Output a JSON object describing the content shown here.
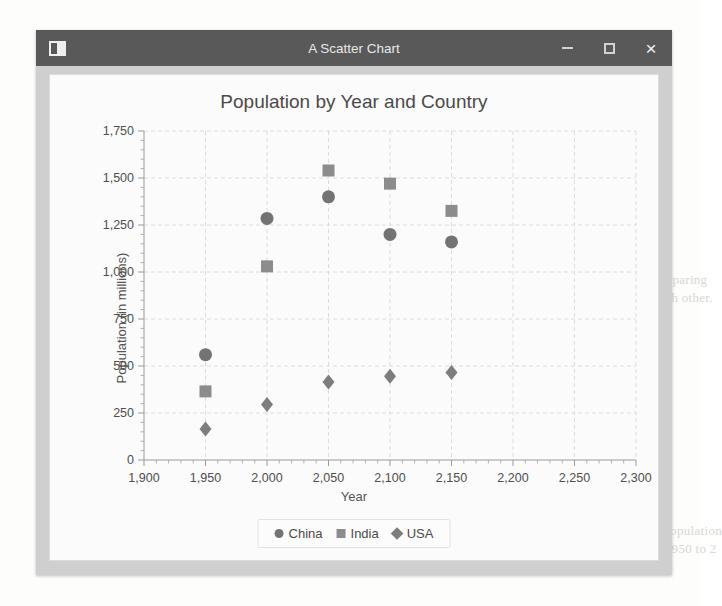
{
  "window": {
    "title": "A Scatter Chart",
    "app_icon": "window-app-icon",
    "controls": {
      "minimize": "–",
      "maximize": "□",
      "close": "×"
    }
  },
  "background_text": [
    "Chart",
    "Scatter plots are useful for comparing",
    "two numeric values against each other.",
    "this case, the example shows a population",
    "estimate for each country from 1950 to 2"
  ],
  "chart_data": {
    "type": "scatter",
    "title": "Population by Year and Country",
    "xlabel": "Year",
    "ylabel": "Population (in millions)",
    "xlim": [
      1900,
      2300
    ],
    "ylim": [
      0,
      1750
    ],
    "xticks": [
      1900,
      1950,
      2000,
      2050,
      2100,
      2150,
      2200,
      2250,
      2300
    ],
    "xticklabels": [
      "1,900",
      "1,950",
      "2,000",
      "2,050",
      "2,100",
      "2,150",
      "2,200",
      "2,250",
      "2,300"
    ],
    "yticks": [
      0,
      250,
      500,
      750,
      1000,
      1250,
      1500,
      1750
    ],
    "yticklabels": [
      "0",
      "250",
      "500",
      "750",
      "1,000",
      "1,250",
      "1,500",
      "1,750"
    ],
    "grid": true,
    "minor_ticks": true,
    "legend_position": "bottom",
    "series": [
      {
        "name": "China",
        "marker": "circle",
        "color": "#737373",
        "points": [
          {
            "x": 1950,
            "y": 560
          },
          {
            "x": 2000,
            "y": 1285
          },
          {
            "x": 2050,
            "y": 1400
          },
          {
            "x": 2100,
            "y": 1200
          },
          {
            "x": 2150,
            "y": 1160
          }
        ]
      },
      {
        "name": "India",
        "marker": "square",
        "color": "#8c8c8c",
        "points": [
          {
            "x": 1950,
            "y": 365
          },
          {
            "x": 2000,
            "y": 1030
          },
          {
            "x": 2050,
            "y": 1540
          },
          {
            "x": 2100,
            "y": 1470
          },
          {
            "x": 2150,
            "y": 1325
          }
        ]
      },
      {
        "name": "USA",
        "marker": "diamond",
        "color": "#7d7d7d",
        "points": [
          {
            "x": 1950,
            "y": 165
          },
          {
            "x": 2000,
            "y": 295
          },
          {
            "x": 2050,
            "y": 415
          },
          {
            "x": 2100,
            "y": 445
          },
          {
            "x": 2150,
            "y": 465
          }
        ]
      }
    ]
  }
}
